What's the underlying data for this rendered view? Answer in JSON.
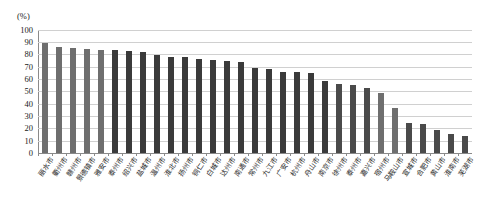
{
  "chart_data": {
    "type": "bar",
    "title": "",
    "subtitle": "",
    "xlabel": "",
    "ylabel": "",
    "unit_label": "(%)",
    "ylim": [
      0,
      100
    ],
    "yticks": [
      0,
      10,
      20,
      30,
      40,
      50,
      60,
      70,
      80,
      90,
      100
    ],
    "grid": true,
    "legend": "none",
    "bar_color_dark": "#3a3a3a",
    "bar_color_mid": "#4a4a4a",
    "bar_color_light": "#6e6e6e",
    "axis_color": "#8a8a8a",
    "gridline_color": "#d0d0d0",
    "categories": [
      "丽水市",
      "衢州市",
      "赣州市",
      "景德镇市",
      "雅安市",
      "泰州市",
      "绍兴市",
      "盐城市",
      "温州市",
      "淮北市",
      "扬州市",
      "铜仁市",
      "白城市",
      "达州市",
      "南通市",
      "常州市",
      "九江市",
      "广安市",
      "杭州市",
      "舟山市",
      "南京市",
      "徐州市",
      "泰州市",
      "嘉兴市",
      "宿州市",
      "马鞍山市",
      "宣城市",
      "合肥市",
      "黄山市",
      "淮南市",
      "芜湖市"
    ],
    "values": [
      89,
      86,
      85,
      84.5,
      83.5,
      83.5,
      82.5,
      81.5,
      79.5,
      77.5,
      77.5,
      76.5,
      75,
      74.5,
      74,
      68.5,
      68,
      66,
      65.5,
      64.5,
      58.5,
      55.5,
      55,
      53,
      49,
      36.5,
      24,
      23.5,
      19,
      15.5,
      13.5
    ],
    "bar_shades": [
      "light",
      "light",
      "light",
      "light",
      "light",
      "dark",
      "dark",
      "dark",
      "dark",
      "dark",
      "dark",
      "dark",
      "dark",
      "dark",
      "dark",
      "dark",
      "dark",
      "dark",
      "dark",
      "dark",
      "dark",
      "mid",
      "mid",
      "mid",
      "light",
      "light",
      "mid",
      "mid",
      "mid",
      "mid",
      "mid"
    ]
  }
}
